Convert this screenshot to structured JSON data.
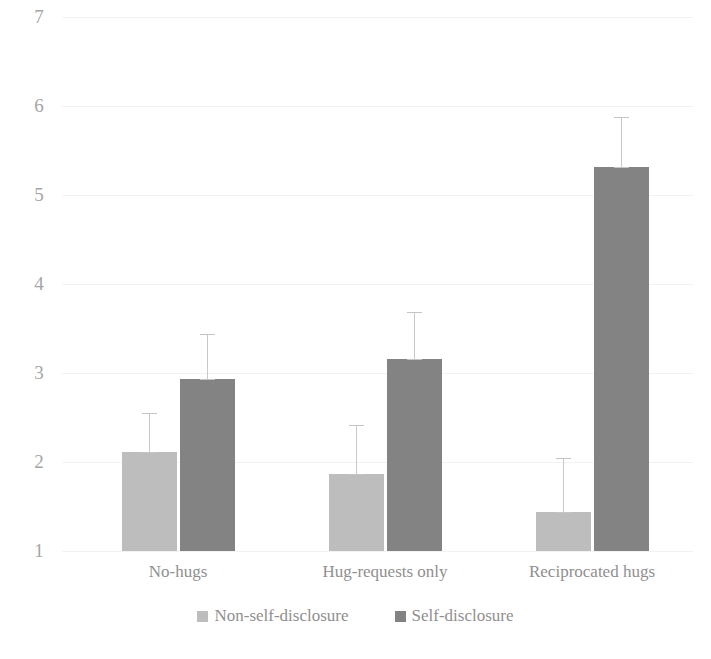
{
  "chart_data": {
    "type": "bar",
    "title": "",
    "subtitle": "",
    "xlabel": "",
    "ylabel": "",
    "categories": [
      "No-hugs",
      "Hug-requests only",
      "Reciprocated hugs"
    ],
    "series": [
      {
        "name": "Non-self-disclosure",
        "color": "#bdbdbd",
        "values": [
          2.11,
          1.87,
          1.44
        ],
        "errors_upper": [
          2.55,
          2.42,
          2.04
        ],
        "errors_lower": [
          2.11,
          1.87,
          1.44
        ]
      },
      {
        "name": "Self-disclosure",
        "color": "#838383",
        "values": [
          2.93,
          3.16,
          5.31
        ],
        "errors_upper": [
          3.44,
          3.68,
          5.88
        ],
        "errors_lower": [
          2.93,
          3.16,
          5.31
        ]
      }
    ],
    "ylim": [
      1,
      7
    ],
    "y_ticks": [
      1,
      2,
      3,
      4,
      5,
      6,
      7
    ],
    "y_tick_labels": [
      "1",
      "2",
      "3",
      "4",
      "5",
      "6",
      "7"
    ],
    "grid": true,
    "grid_axis": "y",
    "legend_position": "bottom",
    "legend_entries": [
      "Non-self-disclosure",
      "Self-disclosure"
    ]
  },
  "axes": {
    "y_tick_labels": [
      "7",
      "6",
      "5",
      "4",
      "3",
      "2",
      "1"
    ],
    "x_category_labels": [
      "No-hugs",
      "Hug-requests only",
      "Reciprocated hugs"
    ]
  },
  "legend": {
    "items": [
      {
        "label": "Non-self-disclosure",
        "color": "#bdbdbd",
        "swatch": "square-swatch"
      },
      {
        "label": "Self-disclosure",
        "color": "#838383",
        "swatch": "square-swatch"
      }
    ]
  }
}
